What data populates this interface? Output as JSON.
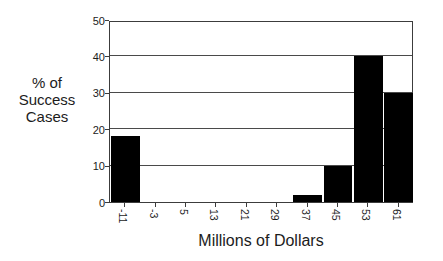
{
  "chart_data": {
    "type": "bar",
    "title": "",
    "subtitle": "",
    "xlabel": "Millions of Dollars",
    "ylabel": "% of Success Cases",
    "ylabel_lines": [
      "% of",
      "Success",
      "Cases"
    ],
    "categories": [
      "-11",
      "-3",
      "5",
      "13",
      "21",
      "29",
      "37",
      "45",
      "53",
      "61"
    ],
    "values": [
      18,
      0,
      0,
      0,
      0,
      0,
      2,
      10,
      40,
      30
    ],
    "ylim": [
      0,
      50
    ],
    "yticks": [
      0,
      10,
      20,
      30,
      40,
      50
    ],
    "ytick_labels": [
      "0",
      "10",
      "20",
      "30",
      "40",
      "50"
    ],
    "xtick_rotation_degrees": 90,
    "grid": true,
    "grid_axis": "y",
    "legend": false,
    "legend_position": "none",
    "bar_color": "#000000",
    "axis_color": "#3c3c3c",
    "grid_color": "#4a4a4a",
    "background_color": "#ffffff",
    "text_color": "#1c1c1c"
  }
}
